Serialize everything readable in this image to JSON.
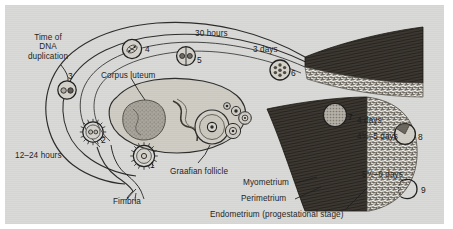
{
  "figure": {
    "background_color": "#d9d9d7",
    "ink_color": "#1d1d1d",
    "myometrium_color": "#3a352f",
    "endometrium_color": "#6f6a61"
  },
  "labels": {
    "time_of_dna_duplication": "Time of\nDNA\nduplication",
    "time_of_dna_l1": "Time of",
    "time_of_dna_l2": "DNA",
    "time_of_dna_l3": "duplication",
    "corpus_luteum": "Corpus luteum",
    "graafian_follicle": "Graafian follicle",
    "fimbria": "Fimbria",
    "myometrium": "Myometrium",
    "perimetrium": "Perimetrium",
    "endometrium": "Endometrium (progestational stage)"
  },
  "timings": {
    "hours_12_24": "12–24 hours",
    "hours_30": "30 hours",
    "days_3": "3 days",
    "days_4": "4 days",
    "days_4h_5": "4½–5 days",
    "days_5h_6": "5½–6 days"
  },
  "stages": [
    {
      "n": "1",
      "name": "ovulated-oocyte-corona-radiata"
    },
    {
      "n": "2",
      "name": "fertilized-ovum-corona-radiata"
    },
    {
      "n": "3",
      "name": "two-pronuclei-zygote"
    },
    {
      "n": "4",
      "name": "first-cleavage-division"
    },
    {
      "n": "5",
      "name": "two-cell-stage"
    },
    {
      "n": "6",
      "name": "morula"
    },
    {
      "n": "7",
      "name": "free-blastocyst"
    },
    {
      "n": "8",
      "name": "attaching-blastocyst"
    },
    {
      "n": "9",
      "name": "implanted-blastocyst"
    }
  ]
}
